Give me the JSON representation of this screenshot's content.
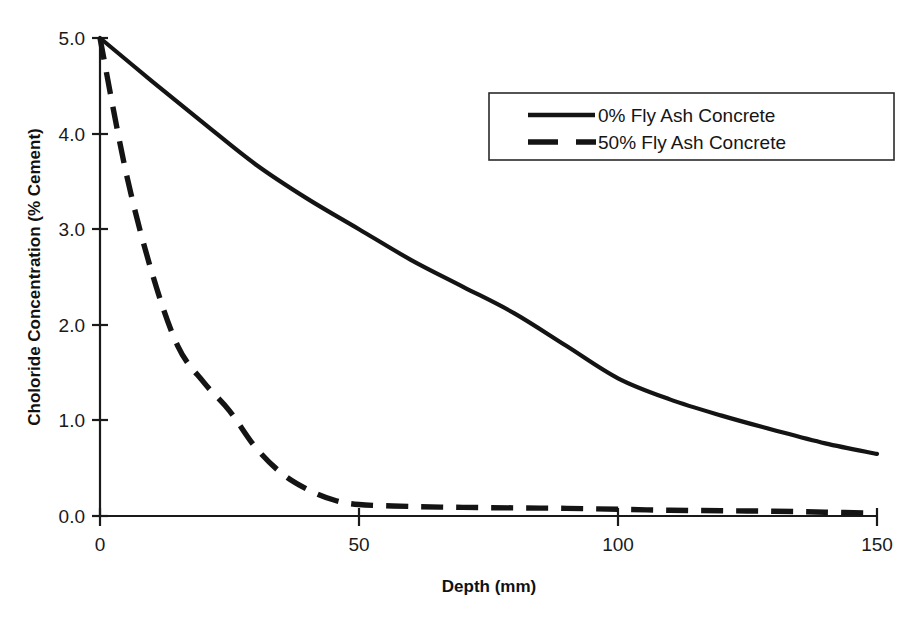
{
  "chart_data": {
    "type": "line",
    "title": "",
    "xlabel": "Depth (mm)",
    "ylabel": "Choloride Concentration (% Cement)",
    "xlim": [
      0,
      150
    ],
    "ylim": [
      0.0,
      5.0
    ],
    "xticks": [
      0,
      50,
      100,
      150
    ],
    "xtick_labels": [
      "0",
      "50",
      "100",
      "150"
    ],
    "yticks": [
      0.0,
      1.0,
      2.0,
      3.0,
      4.0,
      5.0
    ],
    "ytick_labels": [
      "0.0",
      "1.0",
      "2.0",
      "3.0",
      "4.0",
      "5.0"
    ],
    "grid": false,
    "legend_position": "upper right",
    "series": [
      {
        "name": "0% Fly Ash Concrete",
        "style": "solid",
        "color": "#141414",
        "x": [
          0,
          10,
          20,
          30,
          40,
          50,
          60,
          70,
          80,
          90,
          100,
          110,
          120,
          130,
          140,
          150
        ],
        "values": [
          5.0,
          4.55,
          4.11,
          3.68,
          3.32,
          3.0,
          2.68,
          2.4,
          2.12,
          1.78,
          1.44,
          1.22,
          1.05,
          0.9,
          0.76,
          0.65
        ]
      },
      {
        "name": "50% Fly Ash Concrete",
        "style": "dashed",
        "color": "#141414",
        "x": [
          0,
          5,
          10,
          15,
          20,
          25,
          30,
          35,
          40,
          45,
          50,
          60,
          70,
          80,
          90,
          100,
          110,
          120,
          130,
          140,
          150
        ],
        "values": [
          5.0,
          3.6,
          2.55,
          1.78,
          1.4,
          1.1,
          0.72,
          0.45,
          0.28,
          0.17,
          0.12,
          0.1,
          0.09,
          0.085,
          0.08,
          0.07,
          0.06,
          0.055,
          0.05,
          0.04,
          0.03
        ]
      }
    ]
  },
  "legend": {
    "entries": [
      {
        "label": "0% Fly Ash Concrete",
        "style": "solid"
      },
      {
        "label": "50% Fly Ash Concrete",
        "style": "dashed"
      }
    ]
  },
  "axes": {
    "x_title": "Depth (mm)",
    "y_title": "Choloride Concentration (% Cement)",
    "x_tick_0": "0",
    "x_tick_1": "50",
    "x_tick_2": "100",
    "x_tick_3": "150",
    "y_tick_0": "0.0",
    "y_tick_1": "1.0",
    "y_tick_2": "2.0",
    "y_tick_3": "3.0",
    "y_tick_4": "4.0",
    "y_tick_5": "5.0"
  },
  "colors": {
    "ink": "#141414",
    "background": "#ffffff"
  }
}
